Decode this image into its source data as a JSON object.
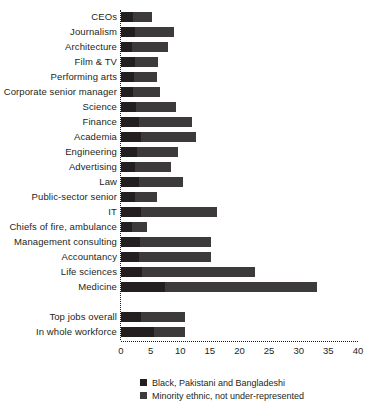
{
  "chart_data": {
    "type": "bar",
    "orientation": "horizontal",
    "stacked": true,
    "title": "",
    "subtitle": "",
    "xlabel": "%",
    "ylabel": "",
    "xlim": [
      0,
      40
    ],
    "xticks": [
      0,
      5,
      10,
      15,
      20,
      25,
      30,
      35,
      40
    ],
    "xtick_labels": [
      "0",
      "5",
      "10",
      "15",
      "20",
      "25",
      "30",
      "35",
      "40"
    ],
    "grid": false,
    "legend_position": "bottom",
    "categories": [
      "CEOs",
      "Journalism",
      "Architecture",
      "Film & TV",
      "Performing arts",
      "Corporate senior manager",
      "Science",
      "Finance",
      "Academia",
      "Engineering",
      "Advertising",
      "Law",
      "Public-sector senior",
      "IT",
      "Chiefs of fire, ambulance",
      "Management consulting",
      "Accountancy",
      "Life sciences",
      "Medicine",
      "",
      "Top jobs overall",
      "In whole workforce"
    ],
    "series": [
      {
        "name": "Black, Pakistani and Bangladeshi",
        "color": "#231f20",
        "values": [
          2.0,
          2.4,
          1.8,
          2.3,
          2.2,
          2.1,
          2.6,
          3.0,
          3.3,
          2.7,
          2.4,
          3.0,
          2.4,
          3.3,
          1.9,
          3.2,
          3.1,
          3.6,
          7.5,
          null,
          3.3,
          5.6
        ]
      },
      {
        "name": "Minority ethnic, not under-represented",
        "color": "#3d3a3b",
        "values": [
          3.3,
          6.6,
          6.2,
          4.0,
          3.8,
          4.5,
          6.7,
          9.0,
          9.3,
          6.9,
          6.1,
          7.5,
          3.6,
          12.9,
          2.5,
          12.0,
          12.1,
          19.0,
          25.5,
          null,
          7.5,
          5.2
        ]
      }
    ],
    "totals": [
      5.3,
      9.0,
      8.0,
      6.3,
      6.0,
      6.6,
      9.3,
      12.0,
      12.6,
      9.6,
      8.5,
      10.5,
      6.0,
      16.2,
      4.4,
      15.2,
      15.2,
      22.6,
      33.0,
      null,
      10.8,
      10.8
    ],
    "legend": [
      "Black, Pakistani and Bangladeshi",
      "Minority ethnic, not under-represented"
    ]
  },
  "colors": {
    "series_a": "#231f20",
    "series_b": "#3d3a3b",
    "background": "#ffffff",
    "text": "#231f20"
  }
}
